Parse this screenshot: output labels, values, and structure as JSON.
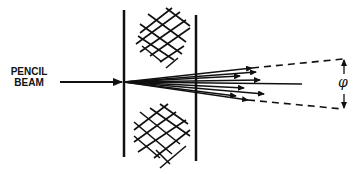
{
  "diagram": {
    "incoming_label_line1": "PENCIL",
    "incoming_label_line2": "BEAM",
    "angle_symbol": "φ",
    "colors": {
      "ink": "#111111",
      "background": "#ffffff"
    }
  }
}
